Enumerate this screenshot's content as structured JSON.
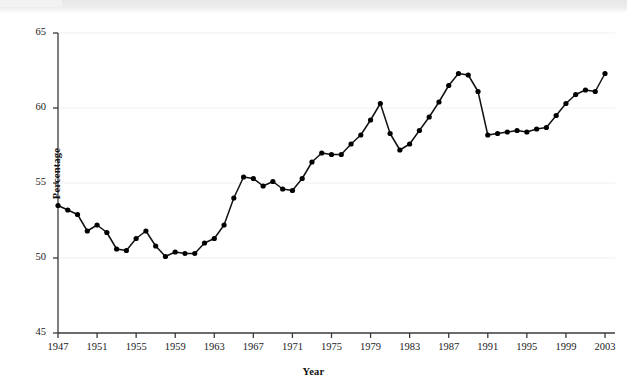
{
  "figure": {
    "background_color": "#ffffff",
    "line_color": "#111111",
    "marker_color": "#000000",
    "axis_color": "#3a3a3a",
    "grid_color": "#f0f0f0"
  },
  "chart_data": {
    "type": "line",
    "title": "",
    "subtitle": "",
    "xlabel": "Year",
    "ylabel": "Percentage",
    "xlim": [
      1947,
      2003
    ],
    "ylim": [
      45,
      65
    ],
    "grid": true,
    "grid_axis": "y",
    "legend": false,
    "legend_position": "none",
    "markers": true,
    "marker_shape": "circle",
    "x_tick_labels": [
      "1947",
      "1951",
      "1955",
      "1959",
      "1963",
      "1967",
      "1971",
      "1975",
      "1979",
      "1983",
      "1987",
      "1991",
      "1995",
      "1999",
      "2003"
    ],
    "x_tick_values": [
      1947,
      1951,
      1955,
      1959,
      1963,
      1967,
      1971,
      1975,
      1979,
      1983,
      1987,
      1991,
      1995,
      1999,
      2003
    ],
    "y_tick_labels": [
      "45",
      "50",
      "55",
      "60",
      "65"
    ],
    "y_tick_values": [
      45,
      50,
      55,
      60,
      65
    ],
    "x": [
      1947,
      1948,
      1949,
      1950,
      1951,
      1952,
      1953,
      1954,
      1955,
      1956,
      1957,
      1958,
      1959,
      1960,
      1961,
      1962,
      1963,
      1964,
      1965,
      1966,
      1967,
      1968,
      1969,
      1970,
      1971,
      1972,
      1973,
      1974,
      1975,
      1976,
      1977,
      1978,
      1979,
      1980,
      1981,
      1982,
      1983,
      1984,
      1985,
      1986,
      1987,
      1988,
      1989,
      1990,
      1991,
      1992,
      1993,
      1994,
      1995,
      1996,
      1997,
      1998,
      1999,
      2000,
      2001,
      2002,
      2003
    ],
    "y": [
      53.5,
      53.2,
      52.9,
      51.8,
      52.2,
      51.7,
      50.6,
      50.5,
      51.3,
      51.8,
      50.8,
      50.1,
      50.4,
      50.3,
      50.3,
      51.0,
      51.3,
      52.2,
      54.0,
      55.4,
      55.3,
      54.8,
      55.1,
      54.6,
      54.5,
      55.3,
      56.4,
      57.0,
      56.9,
      56.9,
      57.6,
      58.2,
      59.2,
      60.3,
      58.3,
      57.2,
      57.6,
      58.5,
      59.4,
      60.4,
      61.5,
      62.3,
      62.2,
      61.1,
      58.2,
      58.3,
      58.4,
      58.5,
      58.4,
      58.6,
      58.7,
      59.5,
      60.3,
      60.9,
      61.2,
      61.1,
      62.3
    ]
  },
  "axes": {
    "y_axis_title": "Percentage",
    "x_axis_title": "Year"
  }
}
